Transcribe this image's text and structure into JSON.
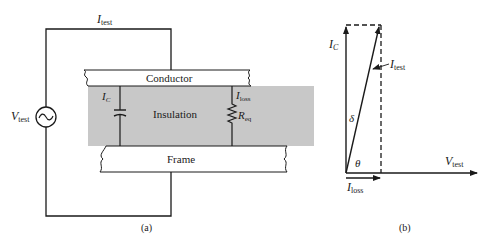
{
  "figure": {
    "panel_a": {
      "caption": "(a)",
      "current_label": {
        "main": "I",
        "sub": "test"
      },
      "source_label": {
        "main": "V",
        "sub": "test"
      },
      "conductor_label": "Conductor",
      "insulation_label": "Insulation",
      "frame_label": "Frame",
      "capacitor_current": {
        "main": "I",
        "sub": "C"
      },
      "loss_current": {
        "main": "I",
        "sub": "loss"
      },
      "resistor_label": {
        "main": "R",
        "sub": "eq"
      },
      "source_symbol": "~"
    },
    "panel_b": {
      "caption": "(b)",
      "ic_label": {
        "main": "I",
        "sub": "C"
      },
      "itest_label": {
        "main": "I",
        "sub": "test"
      },
      "vtest_label": {
        "main": "V",
        "sub": "test"
      },
      "iloss_label": {
        "main": "I",
        "sub": "loss"
      },
      "delta_label": "δ",
      "theta_label": "θ"
    }
  },
  "colors": {
    "line": "#1a1a1a",
    "insulation": "#c8c8c8",
    "background": "#ffffff"
  }
}
